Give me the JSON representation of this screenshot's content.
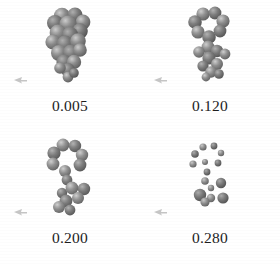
{
  "figure": {
    "type": "molecular-conformation-grid",
    "background_color": "#ffffff",
    "rows": 2,
    "columns": 2,
    "label_color": "#1d1d1d",
    "structure_color_dark": "#6e6e6e",
    "structure_color_mid": "#8a8a8a",
    "structure_color_light": "#b8b8b8",
    "structure_highlight": "#d9d9d9"
  },
  "panels": [
    {
      "label": "0.005",
      "marker": "small-arrow-marker",
      "render_style": "space-filling",
      "description": "dense fused space-filling cluster, vertically elongated",
      "atom_count": 22
    },
    {
      "label": "0.120",
      "marker": "small-arrow-marker",
      "render_style": "space-filling",
      "description": "ring system on top with short chain below, partly open",
      "atom_count": 19
    },
    {
      "label": "0.200",
      "marker": "small-arrow-marker",
      "render_style": "space-filling",
      "description": "open ring at top with extended branched tail",
      "atom_count": 18
    },
    {
      "label": "0.280",
      "marker": "small-arrow-marker",
      "render_style": "ball-model",
      "description": "dissociated small spheres forming an arc and a lower cluster",
      "atom_count": 16
    }
  ]
}
